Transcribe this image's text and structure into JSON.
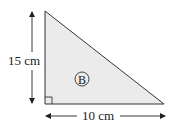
{
  "figure": {
    "shape": "right-triangle",
    "label": "B",
    "fill_color": "#ebebeb",
    "stroke_color": "#333333",
    "height": {
      "label": "15 cm",
      "value": 15,
      "unit": "cm"
    },
    "base": {
      "label": "10 cm",
      "value": 10,
      "unit": "cm"
    },
    "right_angle": "bottom-left"
  }
}
